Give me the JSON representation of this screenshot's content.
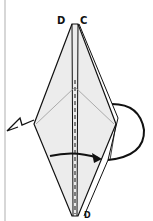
{
  "diagram": {
    "type": "origami-step",
    "labels": {
      "top_left": "D",
      "top_right": "C",
      "bottom": "D"
    },
    "colors": {
      "paper": "#ececec",
      "line": "#111111",
      "crease": "#999999",
      "left_rule": "#bdbdbd"
    }
  }
}
